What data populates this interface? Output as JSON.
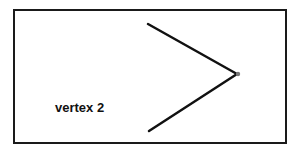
{
  "diagram": {
    "label": "vertex 2",
    "colors": {
      "stroke": "#111111",
      "frame": "#1a1a1a",
      "vertex_dot": "#777777",
      "background": "#ffffff"
    },
    "vertex": {
      "x": 237,
      "y": 74
    },
    "rays": [
      {
        "x1": 237,
        "y1": 74,
        "x2": 148,
        "y2": 24
      },
      {
        "x1": 237,
        "y1": 74,
        "x2": 149,
        "y2": 131
      }
    ]
  }
}
